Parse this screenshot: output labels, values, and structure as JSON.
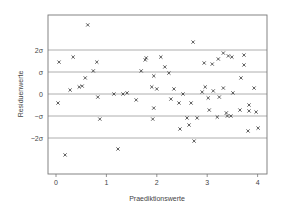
{
  "chart_data": {
    "type": "scatter",
    "title": "",
    "xlabel": "Praediktionswerte",
    "ylabel": "Residuenwerte",
    "xlim": [
      -0.15,
      4.2
    ],
    "ylim": [
      -3.6,
      3.6
    ],
    "x_ticks": [
      0,
      1,
      2,
      3,
      4
    ],
    "x_tick_labels": [
      "0",
      "1",
      "2",
      "3",
      "4"
    ],
    "y_ticks": [
      2,
      1,
      0,
      -1,
      -2
    ],
    "y_tick_labels": [
      "2σ",
      "σ",
      "0",
      "−σ",
      "−2σ"
    ],
    "reference_lines": [
      2,
      1,
      0,
      -1,
      -2
    ],
    "grid": false,
    "legend": null,
    "marker": "x",
    "series": [
      {
        "name": "Residuen",
        "points": [
          [
            0.06,
            1.45
          ],
          [
            0.34,
            1.68
          ],
          [
            0.63,
            3.14
          ],
          [
            0.81,
            1.45
          ],
          [
            0.04,
            -0.41
          ],
          [
            0.18,
            -2.77
          ],
          [
            0.28,
            0.18
          ],
          [
            0.46,
            0.32
          ],
          [
            0.52,
            0.36
          ],
          [
            0.58,
            0.73
          ],
          [
            0.74,
            1.05
          ],
          [
            0.83,
            -0.14
          ],
          [
            0.87,
            -1.14
          ],
          [
            1.15,
            0.0
          ],
          [
            1.23,
            -2.5
          ],
          [
            1.33,
            0.0
          ],
          [
            1.41,
            0.05
          ],
          [
            1.59,
            -0.27
          ],
          [
            1.69,
            1.05
          ],
          [
            1.77,
            1.55
          ],
          [
            1.79,
            1.64
          ],
          [
            1.94,
            0.82
          ],
          [
            1.9,
            0.32
          ],
          [
            1.92,
            -1.14
          ],
          [
            1.94,
            -0.64
          ],
          [
            2.0,
            0.23
          ],
          [
            2.08,
            1.68
          ],
          [
            2.16,
            1.23
          ],
          [
            2.24,
            0.95
          ],
          [
            2.34,
            0.23
          ],
          [
            2.28,
            -0.23
          ],
          [
            2.44,
            -0.41
          ],
          [
            2.52,
            0.0
          ],
          [
            2.6,
            -1.09
          ],
          [
            2.64,
            -1.41
          ],
          [
            2.46,
            -1.59
          ],
          [
            2.74,
            -2.14
          ],
          [
            2.68,
            -0.41
          ],
          [
            2.8,
            -1.09
          ],
          [
            2.72,
            2.36
          ],
          [
            2.9,
            0.09
          ],
          [
            2.96,
            0.32
          ],
          [
            3.04,
            -0.73
          ],
          [
            2.94,
            1.41
          ],
          [
            3.1,
            1.36
          ],
          [
            3.02,
            -0.18
          ],
          [
            3.12,
            0.14
          ],
          [
            3.2,
            -1.05
          ],
          [
            3.24,
            -0.14
          ],
          [
            3.32,
            0.27
          ],
          [
            3.22,
            1.59
          ],
          [
            3.32,
            1.86
          ],
          [
            3.4,
            -1.0
          ],
          [
            3.38,
            -0.86
          ],
          [
            3.42,
            1.73
          ],
          [
            3.47,
            -1.0
          ],
          [
            3.51,
            0.05
          ],
          [
            3.49,
            1.68
          ],
          [
            3.65,
            -0.73
          ],
          [
            3.67,
            0.73
          ],
          [
            3.73,
            1.77
          ],
          [
            3.73,
            1.32
          ],
          [
            3.83,
            -0.5
          ],
          [
            3.83,
            -0.77
          ],
          [
            3.81,
            -1.68
          ],
          [
            3.93,
            0.27
          ],
          [
            3.97,
            -0.82
          ],
          [
            4.01,
            -1.55
          ]
        ]
      }
    ]
  }
}
